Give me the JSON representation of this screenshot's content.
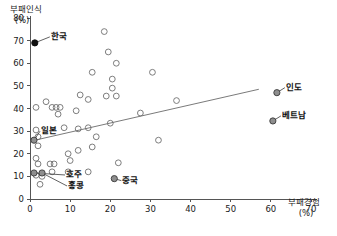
{
  "chart_data": {
    "type": "scatter",
    "title": "",
    "subtitle": "",
    "xlabel": "부패경험",
    "xlabel_unit": "(%)",
    "ylabel": "부패인식",
    "ylabel_unit": "(%)",
    "xlim": [
      0,
      70
    ],
    "ylim": [
      0,
      80
    ],
    "xticks": [
      0,
      10,
      20,
      30,
      40,
      50,
      60,
      70
    ],
    "yticks": [
      0,
      10,
      20,
      30,
      40,
      50,
      60,
      70,
      80
    ],
    "xtick_labels": [
      "0",
      "10",
      "20",
      "30",
      "40",
      "50",
      "60",
      "70"
    ],
    "ytick_labels": [
      "0",
      "10",
      "20",
      "30",
      "40",
      "50",
      "60",
      "70",
      "80"
    ],
    "grid": false,
    "legend": "none",
    "marker": "open-circle",
    "trendline": {
      "present": true,
      "x_start": 0,
      "y_start": 25.5,
      "x_end": 57,
      "y_end": 48.5
    },
    "labeled_points": [
      {
        "name": "한국",
        "x": 1.2,
        "y": 69.0,
        "style": "solid",
        "label_dx": 16,
        "label_dy": -7
      },
      {
        "name": "인도",
        "x": 61.5,
        "y": 47.0,
        "style": "gray",
        "label_dx": 9,
        "label_dy": -6
      },
      {
        "name": "베트남",
        "x": 60.5,
        "y": 34.5,
        "style": "gray",
        "label_dx": 9,
        "label_dy": -6
      },
      {
        "name": "일본",
        "x": 1.0,
        "y": 26.0,
        "style": "gray",
        "label_dx": 7,
        "label_dy": -10
      },
      {
        "name": "호주",
        "x": 1.0,
        "y": 11.5,
        "style": "gray",
        "label_dx": 32,
        "label_dy": 1
      },
      {
        "name": "홍콩",
        "x": 3.0,
        "y": 11.5,
        "style": "gray",
        "label_dx": 26,
        "label_dy": 12
      },
      {
        "name": "중국",
        "x": 21.0,
        "y": 9.0,
        "style": "gray",
        "label_dx": 8,
        "label_dy": 1
      }
    ],
    "points": [
      {
        "x": 18.5,
        "y": 74.0
      },
      {
        "x": 19.5,
        "y": 65.0
      },
      {
        "x": 21.5,
        "y": 60.0
      },
      {
        "x": 15.5,
        "y": 56.0
      },
      {
        "x": 20.5,
        "y": 53.0
      },
      {
        "x": 30.5,
        "y": 56.0
      },
      {
        "x": 20.5,
        "y": 49.0
      },
      {
        "x": 12.5,
        "y": 46.0
      },
      {
        "x": 19.0,
        "y": 45.5
      },
      {
        "x": 21.5,
        "y": 45.5
      },
      {
        "x": 14.5,
        "y": 44.0
      },
      {
        "x": 4.0,
        "y": 43.0
      },
      {
        "x": 1.5,
        "y": 40.5
      },
      {
        "x": 5.5,
        "y": 40.5
      },
      {
        "x": 6.5,
        "y": 40.5
      },
      {
        "x": 7.5,
        "y": 40.5
      },
      {
        "x": 7.0,
        "y": 37.5
      },
      {
        "x": 11.5,
        "y": 39.0
      },
      {
        "x": 27.5,
        "y": 38.0
      },
      {
        "x": 8.5,
        "y": 31.5
      },
      {
        "x": 12.0,
        "y": 31.0
      },
      {
        "x": 14.5,
        "y": 31.5
      },
      {
        "x": 20.0,
        "y": 33.5
      },
      {
        "x": 1.5,
        "y": 30.5
      },
      {
        "x": 2.0,
        "y": 27.5
      },
      {
        "x": 16.5,
        "y": 27.5
      },
      {
        "x": 2.0,
        "y": 23.5
      },
      {
        "x": 9.5,
        "y": 20.0
      },
      {
        "x": 12.0,
        "y": 21.5
      },
      {
        "x": 15.5,
        "y": 23.0
      },
      {
        "x": 1.5,
        "y": 18.0
      },
      {
        "x": 10.0,
        "y": 17.0
      },
      {
        "x": 22.0,
        "y": 16.0
      },
      {
        "x": 32.0,
        "y": 26.0
      },
      {
        "x": 5.0,
        "y": 15.5
      },
      {
        "x": 6.0,
        "y": 15.5
      },
      {
        "x": 2.0,
        "y": 15.5
      },
      {
        "x": 5.5,
        "y": 12.0
      },
      {
        "x": 9.5,
        "y": 12.0
      },
      {
        "x": 14.5,
        "y": 12.0
      },
      {
        "x": 1.5,
        "y": 10.5
      },
      {
        "x": 3.0,
        "y": 10.0
      },
      {
        "x": 2.5,
        "y": 6.5
      },
      {
        "x": 36.5,
        "y": 43.5
      }
    ]
  }
}
